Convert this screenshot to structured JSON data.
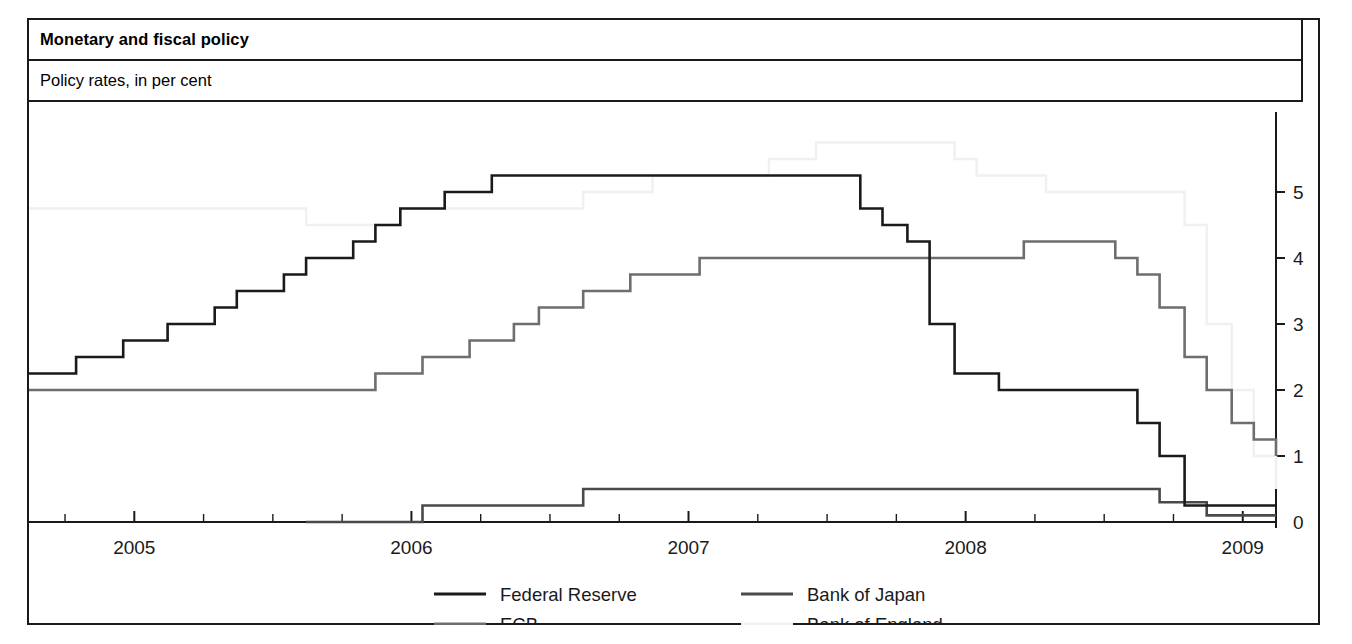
{
  "panel": {
    "title": "Monetary and fiscal policy",
    "subtitle": "Policy rates, in per cent"
  },
  "chart_data": {
    "type": "line",
    "title": "Monetary and fiscal policy",
    "subtitle": "Policy rates, in per cent",
    "xlabel": "",
    "ylabel": "Policy rates, in per cent",
    "step_style": "post",
    "grid": false,
    "legend_position": "bottom",
    "xlim": [
      2004.62,
      2009.12
    ],
    "ylim": [
      0,
      5.6
    ],
    "x_tick_labels": [
      "2005",
      "2006",
      "2007",
      "2008",
      "2009"
    ],
    "x_tick_values": [
      2005,
      2006,
      2007,
      2008,
      2009
    ],
    "x_minor_ticks_per_year": 4,
    "y_tick_labels": [
      "0",
      "1",
      "2",
      "3",
      "4",
      "5"
    ],
    "y_tick_values": [
      0,
      1,
      2,
      3,
      4,
      5
    ],
    "y_axis_side": "right",
    "colors": {
      "federal_reserve": "#1a1a1a",
      "ecb": "#6e6e6e",
      "bank_of_japan": "#4a4a4a",
      "bank_of_england": "#f0f0f0"
    },
    "series": [
      {
        "name": "Federal Reserve",
        "color": "#1a1a1a",
        "points": [
          [
            2004.62,
            2.25
          ],
          [
            2004.79,
            2.5
          ],
          [
            2004.96,
            2.75
          ],
          [
            2005.12,
            3.0
          ],
          [
            2005.29,
            3.25
          ],
          [
            2005.37,
            3.5
          ],
          [
            2005.54,
            3.75
          ],
          [
            2005.62,
            4.0
          ],
          [
            2005.79,
            4.25
          ],
          [
            2005.87,
            4.5
          ],
          [
            2005.96,
            4.75
          ],
          [
            2006.12,
            5.0
          ],
          [
            2006.29,
            5.25
          ],
          [
            2007.62,
            4.75
          ],
          [
            2007.7,
            4.5
          ],
          [
            2007.79,
            4.25
          ],
          [
            2007.87,
            3.0
          ],
          [
            2007.96,
            2.25
          ],
          [
            2008.12,
            2.0
          ],
          [
            2008.62,
            1.5
          ],
          [
            2008.7,
            1.0
          ],
          [
            2008.79,
            0.25
          ],
          [
            2009.12,
            0.25
          ]
        ]
      },
      {
        "name": "ECB",
        "color": "#6e6e6e",
        "points": [
          [
            2004.62,
            2.0
          ],
          [
            2005.87,
            2.25
          ],
          [
            2006.04,
            2.5
          ],
          [
            2006.21,
            2.75
          ],
          [
            2006.37,
            3.0
          ],
          [
            2006.46,
            3.25
          ],
          [
            2006.62,
            3.5
          ],
          [
            2006.79,
            3.75
          ],
          [
            2007.04,
            4.0
          ],
          [
            2008.21,
            4.25
          ],
          [
            2008.54,
            4.0
          ],
          [
            2008.62,
            3.75
          ],
          [
            2008.7,
            3.25
          ],
          [
            2008.79,
            2.5
          ],
          [
            2008.87,
            2.0
          ],
          [
            2008.96,
            1.5
          ],
          [
            2009.04,
            1.25
          ],
          [
            2009.12,
            1.0
          ]
        ]
      },
      {
        "name": "Bank of Japan",
        "color": "#4a4a4a",
        "points": [
          [
            2005.62,
            0.0
          ],
          [
            2006.04,
            0.25
          ],
          [
            2006.62,
            0.5
          ],
          [
            2008.7,
            0.3
          ],
          [
            2008.87,
            0.1
          ],
          [
            2009.12,
            0.1
          ]
        ]
      },
      {
        "name": "Bank of England",
        "color": "#f0f0f0",
        "points": [
          [
            2004.62,
            4.75
          ],
          [
            2005.62,
            4.5
          ],
          [
            2005.96,
            4.75
          ],
          [
            2006.62,
            5.0
          ],
          [
            2006.87,
            5.25
          ],
          [
            2007.29,
            5.5
          ],
          [
            2007.46,
            5.75
          ],
          [
            2007.96,
            5.5
          ],
          [
            2008.04,
            5.25
          ],
          [
            2008.29,
            5.0
          ],
          [
            2008.79,
            4.5
          ],
          [
            2008.87,
            3.0
          ],
          [
            2008.96,
            2.0
          ],
          [
            2009.04,
            1.0
          ],
          [
            2009.12,
            0.5
          ]
        ]
      }
    ]
  },
  "legend": {
    "items": [
      {
        "label": "Federal Reserve",
        "color": "#1a1a1a"
      },
      {
        "label": "Bank of Japan",
        "color": "#4a4a4a"
      },
      {
        "label": "ECB",
        "color": "#6e6e6e"
      },
      {
        "label": "Bank of England",
        "color": "#f0f0f0"
      }
    ]
  }
}
